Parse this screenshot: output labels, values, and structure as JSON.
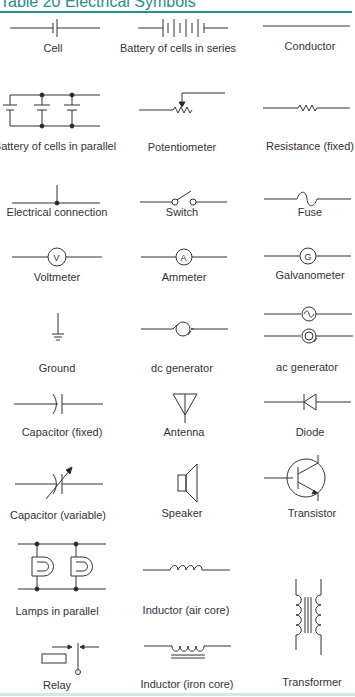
{
  "header": {
    "title": "Table 20   Electrical Symbols",
    "accent_color": "#2a8c8c"
  },
  "symbols": [
    {
      "label": "Cell",
      "icon": "cell-icon"
    },
    {
      "label": "Battery of cells in series",
      "icon": "battery-series-icon"
    },
    {
      "label": "Conductor",
      "icon": "conductor-icon"
    },
    {
      "label": "Battery of cells in parallel",
      "icon": "battery-parallel-icon"
    },
    {
      "label": "Potentiometer",
      "icon": "potentiometer-icon"
    },
    {
      "label": "Resistance (fixed)",
      "icon": "resistor-icon"
    },
    {
      "label": "Electrical connection",
      "icon": "junction-icon"
    },
    {
      "label": "Switch",
      "icon": "switch-icon"
    },
    {
      "label": "Fuse",
      "icon": "fuse-icon"
    },
    {
      "label": "Voltmeter",
      "icon": "voltmeter-icon",
      "glyph": "V"
    },
    {
      "label": "Ammeter",
      "icon": "ammeter-icon",
      "glyph": "A"
    },
    {
      "label": "Galvanometer",
      "icon": "galvanometer-icon",
      "glyph": "G"
    },
    {
      "label": "Ground",
      "icon": "ground-icon"
    },
    {
      "label": "dc generator",
      "icon": "dc-generator-icon"
    },
    {
      "label": "ac generator",
      "icon": "ac-generator-icon"
    },
    {
      "label": "Capacitor (fixed)",
      "icon": "capacitor-fixed-icon"
    },
    {
      "label": "Antenna",
      "icon": "antenna-icon"
    },
    {
      "label": "Diode",
      "icon": "diode-icon"
    },
    {
      "label": "Capacitor (variable)",
      "icon": "capacitor-variable-icon"
    },
    {
      "label": "Speaker",
      "icon": "speaker-icon"
    },
    {
      "label": "Transistor",
      "icon": "transistor-icon"
    },
    {
      "label": "Lamps in parallel",
      "icon": "lamps-parallel-icon"
    },
    {
      "label": "Inductor (air core)",
      "icon": "inductor-air-icon"
    },
    {
      "label": "Transformer",
      "icon": "transformer-icon"
    },
    {
      "label": "Relay",
      "icon": "relay-icon"
    },
    {
      "label": "Inductor (iron core)",
      "icon": "inductor-iron-icon"
    }
  ]
}
